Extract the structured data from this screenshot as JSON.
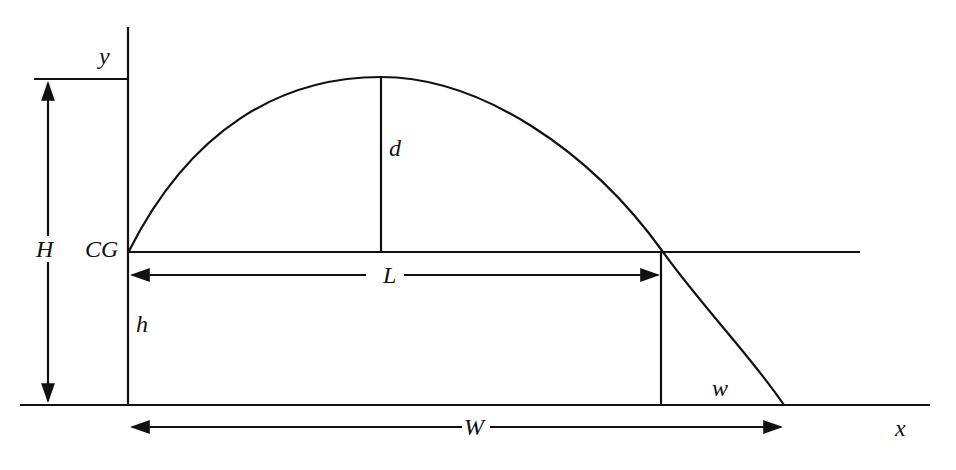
{
  "diagram": {
    "title": "",
    "type": "projectile trajectory above a raised center of gravity",
    "labels": {
      "y_axis": "y",
      "x_axis": "x",
      "total_height": "H",
      "center_of_gravity": "CG",
      "apex_rise": "d",
      "range_at_cg_level": "L",
      "cg_height": "h",
      "extra_range_below_cg": "w",
      "total_range": "W"
    },
    "colors": {
      "line": "#111111",
      "background": "#ffffff"
    }
  }
}
